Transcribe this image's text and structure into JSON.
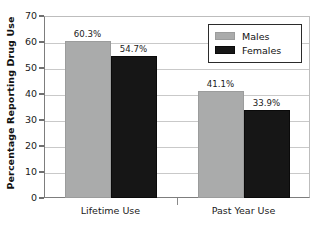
{
  "chart_data": {
    "type": "bar",
    "title": "",
    "subtitle": "",
    "xlabel": "",
    "ylabel": "Percentage Reporting Drug Use",
    "ylim": [
      0,
      70
    ],
    "yticks": [
      0,
      10,
      20,
      30,
      40,
      50,
      60,
      70
    ],
    "ytick_labels": [
      "0",
      "10",
      "20",
      "30",
      "40",
      "50",
      "60",
      "70"
    ],
    "grid": "horizontal",
    "legend_position": "top-right",
    "categories": [
      "Lifetime Use",
      "Past Year Use"
    ],
    "series": [
      {
        "name": "Males",
        "color": "#aaabab",
        "values": [
          60.3,
          41.1
        ],
        "data_labels": [
          "60.3%",
          "41.1%"
        ]
      },
      {
        "name": "Females",
        "color": "#161616",
        "values": [
          54.7,
          33.9
        ],
        "data_labels": [
          "54.7%",
          "33.9%"
        ]
      }
    ]
  },
  "legend": {
    "entries": [
      {
        "label": "Males",
        "swatch": "#aaabab"
      },
      {
        "label": "Females",
        "swatch": "#161616"
      }
    ]
  },
  "axes": {
    "y_title": "Percentage Reporting Drug Use",
    "y_tick_labels": [
      "70",
      "60",
      "50",
      "40",
      "30",
      "20",
      "10",
      "0"
    ],
    "x_tick_labels": [
      "Lifetime Use",
      "Past Year Use"
    ]
  },
  "colors": {
    "males": "#aaabab",
    "females": "#161616",
    "gridline": "#c9c9c9",
    "axis": "#7d7d7d",
    "text": "#1a1a1a"
  }
}
